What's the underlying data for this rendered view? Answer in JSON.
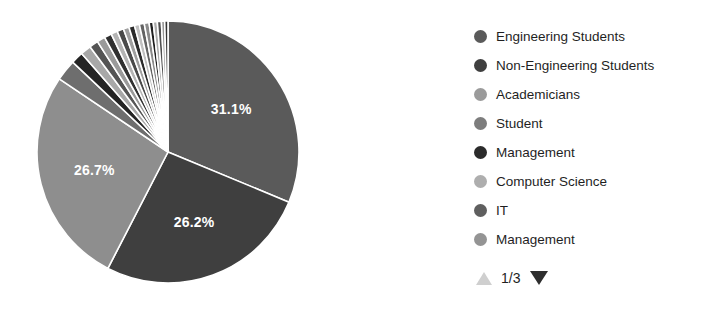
{
  "chart_data": {
    "type": "pie",
    "title": "",
    "legend_position": "right",
    "labels": [
      "Engineering Students",
      "Non-Engineering Students",
      "Academicians",
      "Student",
      "Management",
      "Computer Science",
      "IT",
      "Management"
    ],
    "visible_slice_labels": [
      "26.7%",
      "26.2%",
      "31.1%"
    ],
    "slices": [
      {
        "label": "Engineering Students",
        "value": 31.1,
        "display": "31.1%",
        "color": "#5a5a5a",
        "show_label": true
      },
      {
        "label": "Non-Engineering Students",
        "value": 26.2,
        "display": "26.2%",
        "color": "#3f3f3f",
        "show_label": true
      },
      {
        "label": "Academicians",
        "value": 26.7,
        "display": "26.7%",
        "color": "#8e8e8e",
        "show_label": true
      },
      {
        "label": "Student",
        "value": 2.6,
        "display": "",
        "color": "#6e6e6e",
        "show_label": false
      },
      {
        "label": "Management",
        "value": 1.5,
        "display": "",
        "color": "#242424",
        "show_label": false
      },
      {
        "label": "Computer Science",
        "value": 1.3,
        "display": "",
        "color": "#a8a8a8",
        "show_label": false
      },
      {
        "label": "IT",
        "value": 1.1,
        "display": "",
        "color": "#555555",
        "show_label": false
      },
      {
        "label": "Management",
        "value": 1.0,
        "display": "",
        "color": "#9a9a9a",
        "show_label": false
      },
      {
        "label": "",
        "value": 0.9,
        "display": "",
        "color": "#303030",
        "show_label": false
      },
      {
        "label": "",
        "value": 0.8,
        "display": "",
        "color": "#b4b4b4",
        "show_label": false
      },
      {
        "label": "",
        "value": 0.8,
        "display": "",
        "color": "#4a4a4a",
        "show_label": false
      },
      {
        "label": "",
        "value": 0.7,
        "display": "",
        "color": "#9f9f9f",
        "show_label": false
      },
      {
        "label": "",
        "value": 0.7,
        "display": "",
        "color": "#2a2a2a",
        "show_label": false
      },
      {
        "label": "",
        "value": 0.6,
        "display": "",
        "color": "#c0c0c0",
        "show_label": false
      },
      {
        "label": "",
        "value": 0.6,
        "display": "",
        "color": "#636363",
        "show_label": false
      },
      {
        "label": "",
        "value": 0.6,
        "display": "",
        "color": "#8a8a8a",
        "show_label": false
      },
      {
        "label": "",
        "value": 0.5,
        "display": "",
        "color": "#1f1f1f",
        "show_label": false
      },
      {
        "label": "",
        "value": 0.5,
        "display": "",
        "color": "#ababab",
        "show_label": false
      },
      {
        "label": "",
        "value": 0.5,
        "display": "",
        "color": "#4f4f4f",
        "show_label": false
      },
      {
        "label": "",
        "value": 0.4,
        "display": "",
        "color": "#979797",
        "show_label": false
      },
      {
        "label": "",
        "value": 0.4,
        "display": "",
        "color": "#353535",
        "show_label": false
      }
    ]
  },
  "pie": {
    "center_x": 168,
    "center_y": 152,
    "radius": 131,
    "start_angle": -90,
    "separator_color": "#ffffff",
    "separator_width": 1.6
  },
  "legend": {
    "items": [
      {
        "label": "Engineering Students",
        "color": "#5a5a5a"
      },
      {
        "label": "Non-Engineering Students",
        "color": "#3f3f3f"
      },
      {
        "label": "Academicians",
        "color": "#9b9b9b"
      },
      {
        "label": "Student",
        "color": "#7d7d7d"
      },
      {
        "label": "Management",
        "color": "#2b2b2b"
      },
      {
        "label": "Computer Science",
        "color": "#aeaeae"
      },
      {
        "label": "IT",
        "color": "#5f5f5f"
      },
      {
        "label": "Management",
        "color": "#949494"
      }
    ]
  },
  "pager": {
    "page_text": "1/3",
    "prev_icon": "triangle-up-icon",
    "next_icon": "triangle-down-icon",
    "prev_color": "#cfcfcf",
    "next_color": "#2e2e2e"
  }
}
